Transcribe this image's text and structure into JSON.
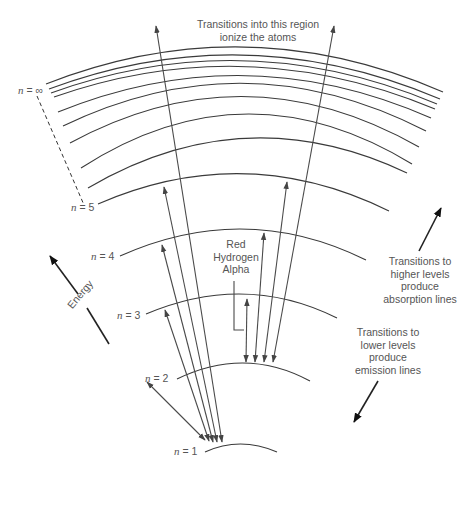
{
  "diagram": {
    "type": "hydrogen energy level diagram",
    "levels": [
      {
        "n": "1",
        "label": "n = 1"
      },
      {
        "n": "2",
        "label": "n = 2"
      },
      {
        "n": "3",
        "label": "n = 3"
      },
      {
        "n": "4",
        "label": "n = 4"
      },
      {
        "n": "5",
        "label": "n = 5"
      },
      {
        "n": "∞",
        "label": "n = ∞"
      }
    ],
    "labels": {
      "n1_var": "n",
      "n1_val": " = 1",
      "n2_var": "n",
      "n2_val": " = 2",
      "n3_var": "n",
      "n3_val": " = 3",
      "n4_var": "n",
      "n4_val": " = 4",
      "n5_var": "n",
      "n5_val": " = 5",
      "ninf_var": "n",
      "ninf_val": " = ∞"
    },
    "annotations": {
      "ionize_line1": "Transitions into this region",
      "ionize_line2": "ionize the atoms",
      "red_line1": "Red",
      "red_line2": "Hydrogen",
      "red_line3": "Alpha",
      "absorb_line1": "Transitions to",
      "absorb_line2": "higher levels",
      "absorb_line3": "produce",
      "absorb_line4": "absorption lines",
      "emit_line1": "Transitions to",
      "emit_line2": "lower levels",
      "emit_line3": "produce",
      "emit_line4": "emission lines",
      "energy": "Energy"
    },
    "colors": {
      "line": "#3a3a3a",
      "text": "#555555",
      "background": "#ffffff"
    }
  }
}
